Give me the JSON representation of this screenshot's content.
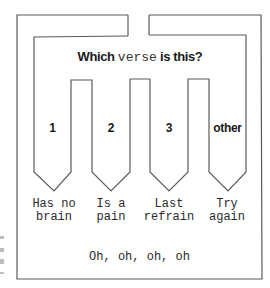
{
  "diagram": {
    "title": {
      "before": "Which ",
      "code_word": "verse",
      "after": " is this?"
    },
    "branches": [
      {
        "choice": "1",
        "result_line1": "Has no",
        "result_line2": "brain"
      },
      {
        "choice": "2",
        "result_line1": "Is a",
        "result_line2": "pain"
      },
      {
        "choice": "3",
        "result_line1": "Last",
        "result_line2": "refrain"
      },
      {
        "choice": "other",
        "result_line1": "Try",
        "result_line2": "again"
      }
    ],
    "footer": "Oh, oh, oh, oh",
    "colors": {
      "line": "#555555",
      "text": "#1a1a1a",
      "background": "#ffffff"
    }
  }
}
